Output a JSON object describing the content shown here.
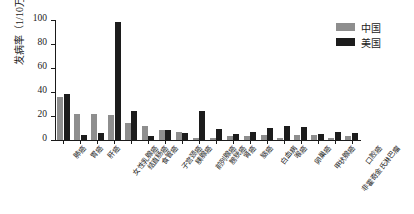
{
  "chart_data": {
    "type": "bar",
    "title": "",
    "subtitle": "",
    "xlabel": "",
    "ylabel": "发病率（1/10万）",
    "ylim": [
      0,
      100
    ],
    "yticks": [
      0,
      20,
      40,
      60,
      80,
      100
    ],
    "ytick_labels": [
      "0",
      "20",
      "40",
      "60",
      "80",
      "100"
    ],
    "grid": false,
    "legend_position": "top-right",
    "categories": [
      "肺癌",
      "胃癌",
      "肝癌",
      "女性乳腺癌",
      "结直肠癌",
      "食管癌",
      "子宫颈癌",
      "胰腺癌",
      "前列腺癌",
      "膀胱癌",
      "肾癌",
      "脑癌",
      "白血病",
      "喉癌",
      "卵巢癌",
      "甲状腺癌",
      "非霍奇金氏淋巴瘤",
      "口腔癌"
    ],
    "series": [
      {
        "name": "中国",
        "color": "#8e8e8e",
        "values": [
          36,
          22,
          22,
          21,
          14,
          12,
          8,
          7,
          2,
          2,
          3,
          3,
          4,
          2,
          4,
          4,
          2,
          3
        ]
      },
      {
        "name": "美国",
        "color": "#1c1c1c",
        "values": [
          38,
          4,
          6,
          98,
          24,
          3,
          8,
          6,
          24,
          9,
          5,
          7,
          10,
          12,
          11,
          5,
          7,
          6
        ]
      }
    ]
  },
  "legend": {
    "items": [
      {
        "label": "中国",
        "color": "#8e8e8e"
      },
      {
        "label": "美国",
        "color": "#1c1c1c"
      }
    ]
  }
}
